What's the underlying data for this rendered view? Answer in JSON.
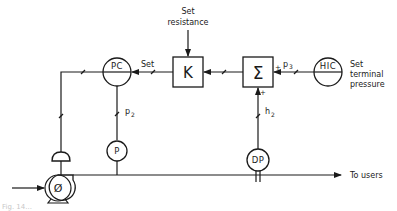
{
  "diagram": {
    "type": "process-control-block-diagram",
    "colors": {
      "line": "#1a1a1a",
      "background": "#ffffff"
    },
    "labels": {
      "set_resistance_line1": "Set",
      "set_resistance_line2": "resistance",
      "set_terminal_line1": "Set",
      "set_terminal_line2": "terminal",
      "set_terminal_line3": "pressure",
      "set_signal": "Set",
      "p2_base": "p",
      "p2_sub": "2",
      "p3_base": "p",
      "p3_sub": "3",
      "h2_base": "h",
      "h2_sub": "2",
      "to_users": "To users",
      "caption": "Fig. 14..."
    },
    "nodes": [
      {
        "id": "pc",
        "shape": "circle-split",
        "label": "PC"
      },
      {
        "id": "k",
        "shape": "box",
        "label": "K"
      },
      {
        "id": "sum",
        "shape": "box",
        "label": "Σ",
        "inputs": [
          "+",
          "+"
        ]
      },
      {
        "id": "hic",
        "shape": "circle-split",
        "label": "HIC"
      },
      {
        "id": "p",
        "shape": "circle",
        "label": "P"
      },
      {
        "id": "dp",
        "shape": "circle",
        "label": "DP"
      },
      {
        "id": "pump",
        "shape": "pump",
        "label": "Ø"
      },
      {
        "id": "actuator",
        "shape": "valve-actuator",
        "label": ""
      }
    ],
    "edges": [
      {
        "from": "set-resistance",
        "to": "k"
      },
      {
        "from": "hic",
        "to": "sum",
        "label": "p3",
        "port": "+"
      },
      {
        "from": "dp",
        "to": "sum",
        "label": "h2",
        "port": "+"
      },
      {
        "from": "sum",
        "to": "k"
      },
      {
        "from": "k",
        "to": "pc",
        "label": "Set"
      },
      {
        "from": "p",
        "to": "pc",
        "label": "p2"
      },
      {
        "from": "pc",
        "to": "actuator"
      },
      {
        "from": "pump",
        "to": "users",
        "label": "To users"
      }
    ]
  }
}
